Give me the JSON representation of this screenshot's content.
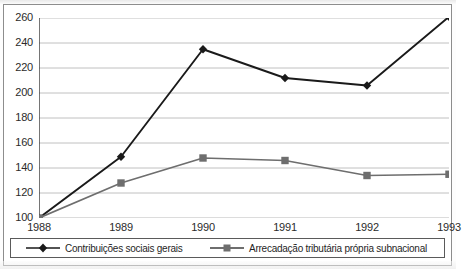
{
  "chart_data": {
    "type": "line",
    "title": "",
    "xlabel": "",
    "ylabel": "",
    "x": [
      "1988",
      "1989",
      "1990",
      "1991",
      "1992",
      "1993"
    ],
    "categories": [
      "1988",
      "1989",
      "1990",
      "1991",
      "1992",
      "1993"
    ],
    "ylim": [
      100,
      260
    ],
    "yticks": [
      100,
      120,
      140,
      160,
      180,
      200,
      220,
      240,
      260
    ],
    "ytick_labels": [
      "100",
      "120",
      "140",
      "160",
      "180",
      "200",
      "220",
      "240",
      "260"
    ],
    "grid": true,
    "grid_axis": "y",
    "legend_position": "bottom",
    "series": [
      {
        "name": "Contribuições sociais gerais",
        "color": "#1a1a1a",
        "marker": "diamond",
        "values": [
          100,
          149,
          235,
          212,
          206,
          261
        ]
      },
      {
        "name": "Arrecadação tributária própria subnacional",
        "color": "#6e6e6e",
        "marker": "square",
        "values": [
          100,
          128,
          148,
          146,
          134,
          135
        ]
      }
    ]
  },
  "legend": {
    "items": [
      {
        "label": "Contribuições sociais gerais"
      },
      {
        "label": "Arrecadação tributária própria subnacional"
      }
    ]
  },
  "colors": {
    "series_1": "#1a1a1a",
    "series_2": "#6e6e6e",
    "grid": "#b9b9b9",
    "axis": "#3a3a3a",
    "frame": "#8d8d8d",
    "legend_border": "#5a5a5a",
    "background": "#ffffff"
  }
}
